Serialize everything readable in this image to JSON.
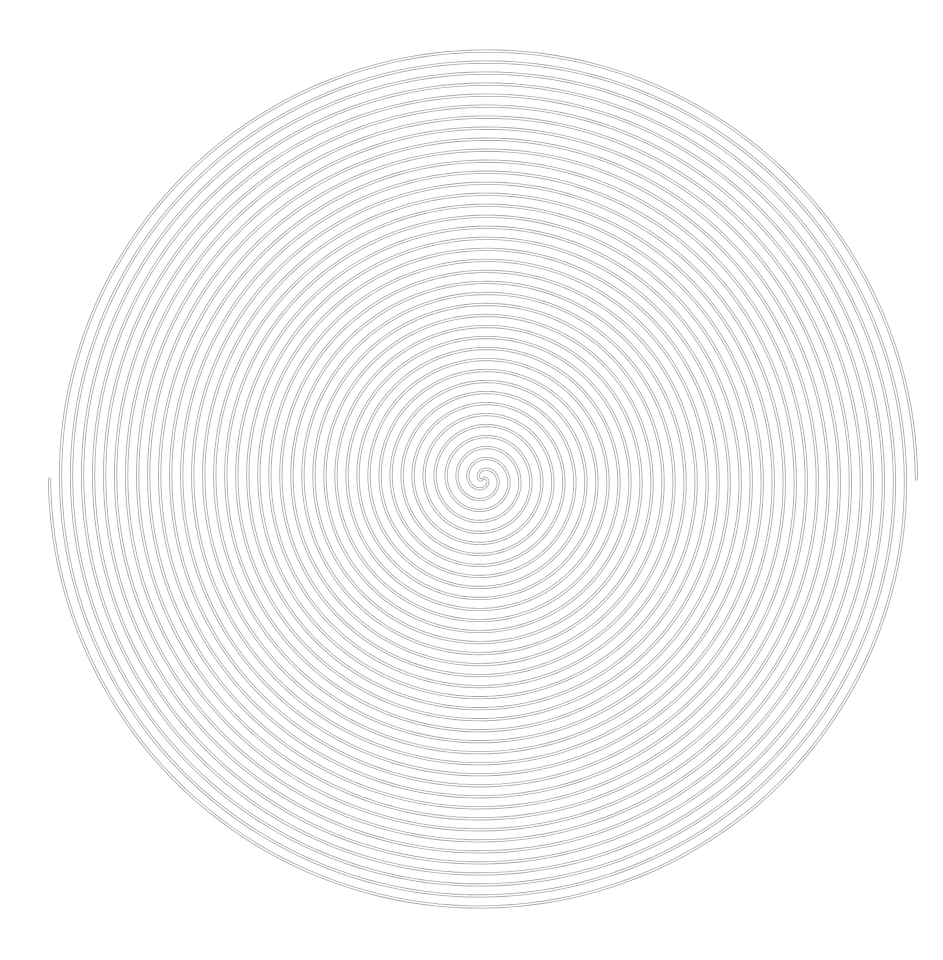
{
  "canvas": {
    "width": 943,
    "height": 960,
    "background": "#ffffff"
  },
  "spiral": {
    "type": "double-arm archimedean spiral",
    "center": [
      483,
      479
    ],
    "outer_radius": 432,
    "arms": 2,
    "turns_per_arm": 19.6,
    "arm_start_angle_deg": [
      180,
      0
    ],
    "line_color": "#a9a9a9",
    "tube_outer_width": 3.2,
    "tube_inner_width": 1.5,
    "inner_color": "#ffffff",
    "end_points": {
      "left_arm_end": [
        51,
        482
      ],
      "right_arm_end": [
        914,
        477
      ]
    }
  }
}
